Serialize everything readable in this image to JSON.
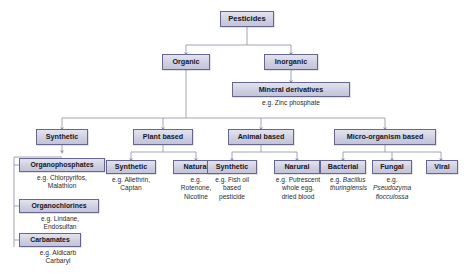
{
  "diagram": {
    "style": {
      "node_fill": "#cfcfe2",
      "node_border": "#66668f",
      "connector": "#8e8e9e",
      "background": "#ffffff",
      "text": "#15151c"
    },
    "nodes": {
      "root": "Pesticides",
      "organic": "Organic",
      "inorganic": "Inorganic",
      "mineral_derivatives": "Mineral derivatives",
      "synthetic_main": "Synthetic",
      "plant_based": "Plant based",
      "animal_based": "Animal based",
      "micro_organism_based": "Micro-organism based",
      "organophosphates": "Organophosphates",
      "organochlorines": "Organochlorines",
      "carbamates": "Carbamates",
      "plant_synthetic": "Synthetic",
      "plant_natural": "Natural",
      "animal_synthetic": "Synthetic",
      "animal_natural": "Narural",
      "bacterial": "Bacterial",
      "fungal": "Fungal",
      "viral": "Viral"
    },
    "captions": {
      "mineral_derivatives_eg": "e.g. Zinc phosphate",
      "organophosphates_eg_l1": "e.g. Chlorpyrifos,",
      "organophosphates_eg_l2": "Malathion",
      "organochlorines_eg_l1": "e.g. Lindane,",
      "organochlorines_eg_l2": "Endosulfan",
      "carbamates_eg_l1": "e.g. Aldicarb",
      "carbamates_eg_l2": "Carbaryl",
      "plant_synthetic_eg_l1": "e.g. Allethrin,",
      "plant_synthetic_eg_l2": "Captan",
      "plant_natural_eg_l1": "e.g.",
      "plant_natural_eg_l2": "Rotenone,",
      "plant_natural_eg_l3": "Nicotine",
      "animal_synthetic_eg_l1": "e.g. Fish oil",
      "animal_synthetic_eg_l2": "based",
      "animal_synthetic_eg_l3": "pesticide",
      "animal_natural_eg_l1": "e.g. Putrescent",
      "animal_natural_eg_l2": "whole egg,",
      "animal_natural_eg_l3": "dried blood",
      "bacterial_eg_prefix": "e.g. ",
      "bacterial_eg_species_l1": "Bacillus",
      "bacterial_eg_species_l2": "thuringiensis",
      "fungal_eg_prefix": "e.g.",
      "fungal_eg_species_l1": "Pseudozyma",
      "fungal_eg_species_l2": "flocculossa"
    }
  }
}
